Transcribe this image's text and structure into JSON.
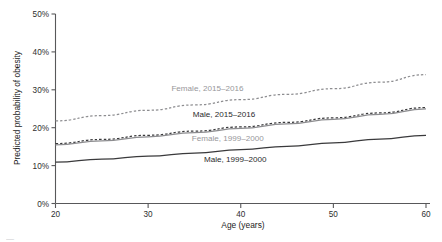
{
  "chart_data": {
    "type": "line",
    "title": "",
    "xlabel": "Age (years)",
    "ylabel": "Predicted probability of obesity",
    "xlim": [
      20,
      60
    ],
    "ylim": [
      0,
      50
    ],
    "grid": false,
    "legend_position": "inline-labels",
    "x_ticks": [
      "20",
      "30",
      "40",
      "50",
      "60"
    ],
    "x_tick_values": [
      20,
      30,
      40,
      50,
      60
    ],
    "y_ticks": [
      "0%",
      "10%",
      "20%",
      "30%",
      "40%",
      "50%"
    ],
    "y_tick_values": [
      0,
      10,
      20,
      30,
      40,
      50
    ],
    "x": [
      20,
      25,
      30,
      35,
      40,
      45,
      50,
      55,
      60
    ],
    "series": [
      {
        "name": "Female, 2015-2016",
        "label": "Female, 2015–2016",
        "style": "dashed",
        "color": "#8d8d90",
        "values": [
          21.8,
          23.2,
          24.6,
          26.0,
          27.4,
          28.8,
          30.3,
          32.0,
          34.0
        ]
      },
      {
        "name": "Male, 2015-2016",
        "label": "Male, 2015–2016",
        "style": "dashed",
        "color": "#3a3a3c",
        "values": [
          15.8,
          16.9,
          18.0,
          19.1,
          20.2,
          21.4,
          22.6,
          23.9,
          25.3
        ]
      },
      {
        "name": "Female, 1999-2000",
        "label": "Female, 1999–2000",
        "style": "solid",
        "color": "#8d8d90",
        "values": [
          15.5,
          16.5,
          17.6,
          18.7,
          19.8,
          21.0,
          22.2,
          23.5,
          25.0
        ]
      },
      {
        "name": "Male, 1999-2000",
        "label": "Male, 1999–2000",
        "style": "solid",
        "color": "#3a3a3c",
        "values": [
          10.9,
          11.7,
          12.5,
          13.3,
          14.2,
          15.1,
          16.0,
          17.0,
          18.0
        ]
      }
    ],
    "inline_labels": [
      {
        "text": "Female, 2015–2016",
        "series": "Female, 2015-2016",
        "x": 36.4,
        "y_pct": 30.4,
        "color": "#97979a"
      },
      {
        "text": "Male, 2015–2016",
        "series": "Male, 2015-2016",
        "x": 38.2,
        "y_pct": 23.5,
        "color": "#2a2a2c"
      },
      {
        "text": "Female, 1999–2000",
        "series": "Female, 1999-2000",
        "x": 38.6,
        "y_pct": 17.4,
        "color": "#97979a"
      },
      {
        "text": "Male, 1999–2000",
        "series": "Male, 1999-2000",
        "x": 39.4,
        "y_pct": 11.7,
        "color": "#2a2a2c"
      }
    ]
  },
  "caption": {
    "text": "—"
  }
}
